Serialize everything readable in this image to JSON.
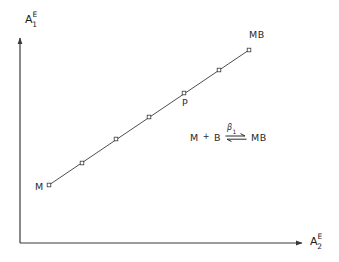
{
  "figure": {
    "background_color": "#ffffff",
    "line_color": "#3a3a3a",
    "text_color": "#2a2a2a"
  },
  "axes": {
    "y_label": {
      "base": "A",
      "superscript": "E",
      "subscript": "1"
    },
    "x_label": {
      "base": "A",
      "superscript": "E",
      "subscript": "2"
    },
    "origin_x": 20,
    "origin_y": 243,
    "x_axis_end": 304,
    "y_axis_top": 36,
    "arrowheads": true,
    "ticks": false,
    "grid": false
  },
  "annotations": {
    "start_label": "M",
    "mid_label": "P",
    "end_label": "MB"
  },
  "equation": {
    "reactant_1": "M",
    "plus": "+",
    "reactant_2": "B",
    "rate_constant_base": "β",
    "rate_constant_subscript": "1",
    "product": "MB",
    "arrow_type": "equilibrium-double-harpoon"
  },
  "chart_data": {
    "type": "scatter",
    "title": "",
    "xlabel": "A2E",
    "ylabel": "A1E",
    "grid": false,
    "legend": null,
    "axis_arrows": true,
    "series": [
      {
        "name": "M-MB titration line",
        "marker": "open-square",
        "line": "solid",
        "points_px": [
          {
            "x": 49,
            "y": 185,
            "label": "M"
          },
          {
            "x": 82,
            "y": 163,
            "label": ""
          },
          {
            "x": 116,
            "y": 139,
            "label": ""
          },
          {
            "x": 149,
            "y": 117,
            "label": ""
          },
          {
            "x": 184,
            "y": 93,
            "label": "P"
          },
          {
            "x": 219,
            "y": 70,
            "label": ""
          },
          {
            "x": 249,
            "y": 50,
            "label": "MB"
          }
        ]
      }
    ]
  }
}
